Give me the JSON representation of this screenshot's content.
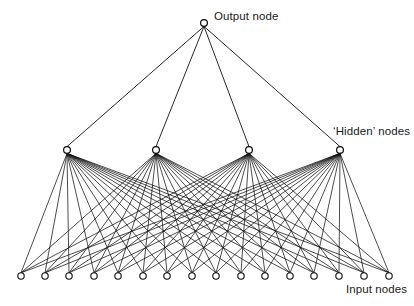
{
  "figure": {
    "kind": "neural-network-diagram",
    "background_color": "#ffffff",
    "line_color": "#111111",
    "node_fill_color": "#ffffff",
    "node_stroke_color": "#0a0a0a",
    "width": 414,
    "height": 306
  },
  "labels": {
    "output": "Output node",
    "hidden": "‘Hidden’ nodes",
    "input": "Input nodes"
  },
  "chart_data": {
    "type": "diagram",
    "title": "",
    "layers": [
      {
        "name": "output",
        "label": "Output node",
        "count": 1,
        "node_radius": 3.4,
        "y": 23,
        "x": [
          204
        ]
      },
      {
        "name": "hidden",
        "label": "‘Hidden’ nodes",
        "count": 4,
        "node_radius": 3.4,
        "y": 150,
        "x": [
          67,
          156,
          249,
          340
        ]
      },
      {
        "name": "input",
        "label": "Input nodes",
        "count": 16,
        "node_radius": 3.2,
        "y": 276,
        "x": [
          21,
          45,
          69,
          94,
          118,
          143,
          167,
          192,
          216,
          241,
          265,
          290,
          314,
          339,
          364,
          389
        ]
      }
    ],
    "connections": [
      {
        "from": "hidden",
        "to": "output",
        "fully_connected": true,
        "edge_count": 4
      },
      {
        "from": "input",
        "to": "hidden",
        "fully_connected": true,
        "edge_count": 64
      }
    ]
  }
}
